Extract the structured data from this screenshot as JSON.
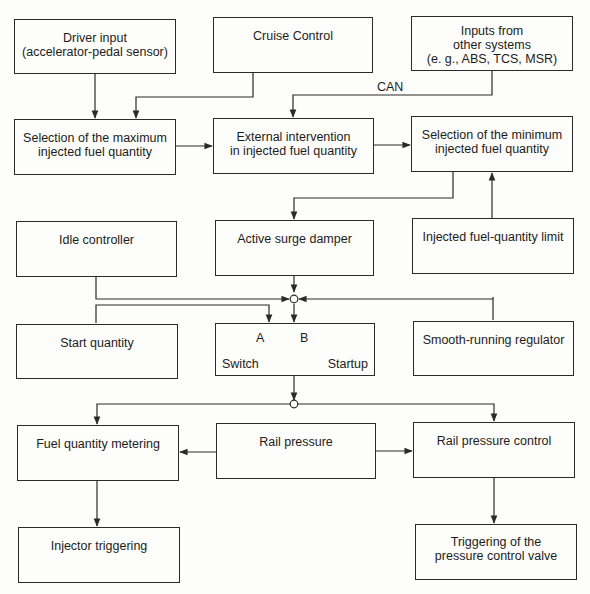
{
  "diagram": {
    "boxes": {
      "driver_input": "Driver input\n(accelerator-pedal sensor)",
      "cruise_control": "Cruise Control",
      "other_inputs": "Inputs from\nother systems\n(e. g., ABS, TCS, MSR)",
      "select_max": "Selection of the maximum\ninjected fuel quantity",
      "external_intervention": "External intervention\nin injected fuel quantity",
      "select_min": "Selection of the minimum\ninjected fuel quantity",
      "idle_controller": "Idle controller",
      "surge_damper": "Active surge damper",
      "fuel_limit": "Injected fuel-quantity limit",
      "start_quantity": "Start quantity",
      "smooth_running": "Smooth-running regulator",
      "fuel_metering": "Fuel quantity metering",
      "rail_pressure": "Rail pressure",
      "rail_pressure_control": "Rail pressure control",
      "injector_triggering": "Injector triggering",
      "pcv_triggering": "Triggering of the\npressure control valve"
    },
    "switch": {
      "a_label": "A",
      "b_label": "B",
      "switch_label": "Switch",
      "startup_label": "Startup"
    },
    "can_label": "CAN",
    "line_color": "#2a2a2a"
  }
}
